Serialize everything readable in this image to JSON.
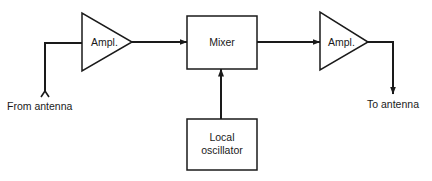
{
  "diagram": {
    "title": "",
    "nodes": [
      {
        "id": "ampl1",
        "type": "amplifier-triangle",
        "label": "Ampl."
      },
      {
        "id": "mixer",
        "type": "box",
        "label": "Mixer"
      },
      {
        "id": "ampl2",
        "type": "amplifier-triangle",
        "label": "Ampl."
      },
      {
        "id": "local_osc",
        "type": "box",
        "label_lines": [
          "Local",
          "oscillator"
        ]
      }
    ],
    "edges": [
      {
        "from": "from_antenna",
        "to": "ampl1",
        "arrow": false
      },
      {
        "from": "ampl1",
        "to": "mixer",
        "arrow": true
      },
      {
        "from": "local_osc",
        "to": "mixer",
        "arrow": true
      },
      {
        "from": "mixer",
        "to": "ampl2",
        "arrow": true
      },
      {
        "from": "ampl2",
        "to": "to_antenna",
        "arrow": true
      }
    ],
    "labels": {
      "from_antenna": "From antenna",
      "to_antenna": "To antenna",
      "ampl1": "Ampl.",
      "mixer": "Mixer",
      "ampl2": "Ampl.",
      "local_osc_line1": "Local",
      "local_osc_line2": "oscillator"
    },
    "colors": {
      "stroke": "#1a1a1a",
      "background": "#ffffff"
    }
  }
}
